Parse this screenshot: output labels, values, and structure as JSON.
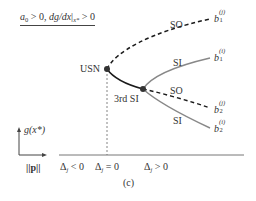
{
  "figure": {
    "panel_label": "(c)",
    "condition": {
      "a": "a",
      "a_sub": "0",
      "text1": " > 0, ",
      "deriv": "dg/dx",
      "bar": "|",
      "eval_sub": "x*",
      "text2": " > 0"
    },
    "axes": {
      "y_label": "g(x*)",
      "x_label": "||p||"
    },
    "x_ticks": [
      {
        "delta": "Δ",
        "sub": "j",
        "rel": " < 0"
      },
      {
        "delta": "Δ",
        "sub": "j",
        "rel": " = 0"
      },
      {
        "delta": "Δ",
        "sub": "j",
        "rel": " > 0"
      }
    ],
    "points": {
      "usn": "USN",
      "third_si": "3rd SI"
    },
    "branch_labels": {
      "so_upper": "SO",
      "si_upper": "SI",
      "so_lower": "SO",
      "si_lower": "SI"
    },
    "endpoints": [
      {
        "base": "b",
        "sup": "(j)",
        "sub": "1"
      },
      {
        "base": "b",
        "sup": "(i)",
        "sub": "1"
      },
      {
        "base": "b",
        "sup": "(j)",
        "sub": "2"
      },
      {
        "base": "b",
        "sup": "(i)",
        "sub": "2"
      }
    ],
    "colors": {
      "stable_branch": "#888888",
      "unstable_branch": "#1a1a1a",
      "node": "#333333",
      "axis": "#555555"
    }
  }
}
